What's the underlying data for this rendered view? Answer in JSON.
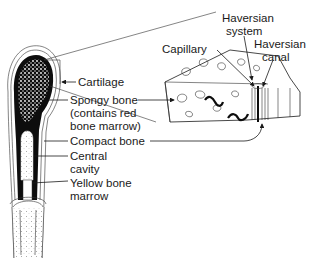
{
  "diagram": {
    "labels": {
      "cartilage": "Cartilage",
      "spongy_bone_1": "Spongy bone",
      "spongy_bone_2": "(contains red",
      "spongy_bone_3": "bone marrow)",
      "compact_bone": "Compact bone",
      "central_cavity_1": "Central",
      "central_cavity_2": "cavity",
      "yellow_marrow_1": "Yellow bone",
      "yellow_marrow_2": "marrow",
      "haversian_system_1": "Haversian",
      "haversian_system_2": "system",
      "capillary": "Capillary",
      "haversian_canal_1": "Haversian",
      "haversian_canal_2": "canal"
    },
    "colors": {
      "ink": "#1a1a1a",
      "background": "#ffffff",
      "compact_fill": "#0d0d0d"
    }
  }
}
